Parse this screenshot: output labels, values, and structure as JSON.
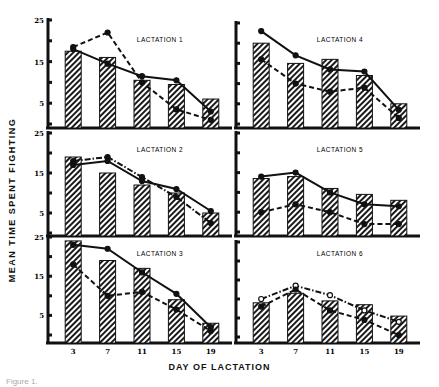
{
  "figure": {
    "ylabel": "MEAN TIME SPENT FIGHTING",
    "xlabel": "DAY OF LACTATION",
    "caption_partial": "Figure 1."
  },
  "chart_data": [
    {
      "type": "bar",
      "title": "LACTATION 1",
      "categories": [
        "3",
        "7",
        "11",
        "15",
        "19"
      ],
      "ylim": [
        0,
        25
      ],
      "yticks": [
        "25",
        "15",
        "5"
      ],
      "bars": [
        17.5,
        16,
        10.5,
        9.5,
        6
      ],
      "series": [
        {
          "name": "solid",
          "style": "solid",
          "marker": "filled",
          "values": [
            18,
            14.5,
            11.5,
            10.5,
            3
          ]
        },
        {
          "name": "dashed",
          "style": "dashed",
          "marker": "filled",
          "values": [
            18.5,
            22,
            10,
            3.5,
            1
          ]
        }
      ]
    },
    {
      "type": "bar",
      "title": "LACTATION 4",
      "categories": [
        "3",
        "7",
        "11",
        "15",
        "19"
      ],
      "ylim": [
        0,
        25
      ],
      "bars": [
        20,
        15,
        16,
        12,
        5
      ],
      "series": [
        {
          "name": "solid",
          "style": "solid",
          "marker": "filled",
          "values": [
            23,
            17,
            13.5,
            13,
            3.5
          ]
        },
        {
          "name": "dashed",
          "style": "dashed",
          "marker": "filled",
          "values": [
            16,
            10,
            8,
            9,
            1.5
          ]
        }
      ]
    },
    {
      "type": "bar",
      "title": "LACTATION 2",
      "categories": [
        "3",
        "7",
        "11",
        "15",
        "19"
      ],
      "ylim": [
        0,
        25
      ],
      "yticks": [
        "25",
        "15",
        "5"
      ],
      "bars": [
        19,
        15,
        12,
        10,
        5
      ],
      "series": [
        {
          "name": "solid",
          "style": "solid",
          "marker": "filled",
          "values": [
            17,
            18,
            13,
            11,
            5.5
          ]
        },
        {
          "name": "dash-dot",
          "style": "dashdot",
          "marker": "filled",
          "values": [
            18,
            19,
            14,
            9,
            2.5
          ]
        }
      ]
    },
    {
      "type": "bar",
      "title": "LACTATION 5",
      "categories": [
        "3",
        "7",
        "11",
        "15",
        "19"
      ],
      "ylim": [
        0,
        25
      ],
      "bars": [
        13.5,
        14,
        11,
        9.5,
        8
      ],
      "series": [
        {
          "name": "solid",
          "style": "solid",
          "marker": "filled",
          "values": [
            14,
            15,
            10,
            7,
            6.5
          ]
        },
        {
          "name": "dashed",
          "style": "dashed",
          "marker": "filled",
          "values": [
            5,
            7,
            5,
            2,
            2
          ]
        }
      ]
    },
    {
      "type": "bar",
      "title": "LACTATION 3",
      "categories": [
        "3",
        "7",
        "11",
        "15",
        "19"
      ],
      "ylim": [
        0,
        25
      ],
      "yticks": [
        "25",
        "15",
        "5"
      ],
      "bars": [
        24,
        19,
        17,
        9,
        3
      ],
      "series": [
        {
          "name": "solid",
          "style": "solid",
          "marker": "filled",
          "values": [
            23,
            22,
            16,
            10.5,
            2
          ]
        },
        {
          "name": "dashed",
          "style": "dashed",
          "marker": "filled",
          "values": [
            18,
            10,
            11,
            6.5,
            1
          ]
        }
      ]
    },
    {
      "type": "bar",
      "title": "LACTATION 6",
      "categories": [
        "3",
        "7",
        "11",
        "15",
        "19"
      ],
      "ylim": [
        0,
        25
      ],
      "bars": [
        9,
        11.5,
        9.5,
        8.5,
        5.5
      ],
      "series": [
        {
          "name": "dash-dot",
          "style": "dashdot",
          "marker": "open",
          "values": [
            10,
            13.5,
            11,
            7,
            4
          ]
        },
        {
          "name": "dashed",
          "style": "dashed",
          "marker": "filled",
          "values": [
            8,
            12.5,
            7,
            4.5,
            0.5
          ]
        }
      ]
    }
  ],
  "layout": {
    "panels": [
      {
        "x0": 48,
        "x1": 232,
        "y25": 20,
        "y0": 124,
        "base": 128,
        "label_x": 160,
        "label_y": 42
      },
      {
        "x0": 236,
        "x1": 420,
        "y25": 23,
        "y0": 124,
        "base": 128,
        "label_x": 340,
        "label_y": 42
      },
      {
        "x0": 48,
        "x1": 232,
        "y25": 133,
        "y0": 233,
        "base": 236,
        "label_x": 160,
        "label_y": 152
      },
      {
        "x0": 236,
        "x1": 420,
        "y25": 133,
        "y0": 232,
        "base": 236,
        "label_x": 340,
        "label_y": 152
      },
      {
        "x0": 48,
        "x1": 232,
        "y25": 237,
        "y0": 335,
        "base": 343,
        "label_x": 160,
        "label_y": 256
      },
      {
        "x0": 236,
        "x1": 420,
        "y25": 242,
        "y0": 337,
        "base": 343,
        "label_x": 340,
        "label_y": 256
      }
    ]
  }
}
